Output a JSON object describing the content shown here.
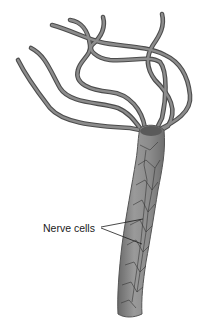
{
  "figure": {
    "labels": [
      {
        "text": "Nerve cells",
        "pointer_count": 2
      }
    ]
  },
  "colors": {
    "body_fill": "#8a8a8a",
    "body_dark": "#5e5e5e",
    "tentacle": "#6f6f6f",
    "tentacle_edge": "#4a4a4a",
    "nerve_net": "#3a3a3a",
    "label_text": "#1a1a1a",
    "background": "#ffffff"
  }
}
